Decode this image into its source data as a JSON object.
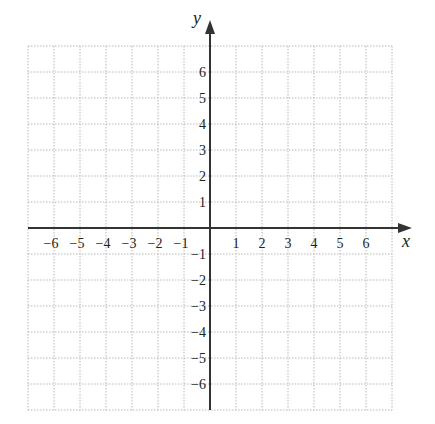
{
  "chart_data": {
    "type": "scatter",
    "title": "",
    "xlabel": "x",
    "ylabel": "y",
    "xlim": [
      -7,
      7
    ],
    "ylim": [
      -7,
      7
    ],
    "grid": true,
    "grid_style": "dotted",
    "x_ticks": [
      -6,
      -5,
      -4,
      -3,
      -2,
      -1,
      1,
      2,
      3,
      4,
      5,
      6
    ],
    "y_ticks": [
      -6,
      -5,
      -4,
      -3,
      -2,
      -1,
      1,
      2,
      3,
      4,
      5,
      6
    ],
    "x_tick_labels": [
      "−6",
      "−5",
      "−4",
      "−3",
      "−2",
      "−1",
      "1",
      "2",
      "3",
      "4",
      "5",
      "6"
    ],
    "y_tick_labels": [
      "−6",
      "−5",
      "−4",
      "−3",
      "−2",
      "−1",
      "1",
      "2",
      "3",
      "4",
      "5",
      "6"
    ],
    "series": [],
    "legend": null
  },
  "colors": {
    "axis": "#333333",
    "grid": "#b8b8b8",
    "text": "#222222"
  }
}
